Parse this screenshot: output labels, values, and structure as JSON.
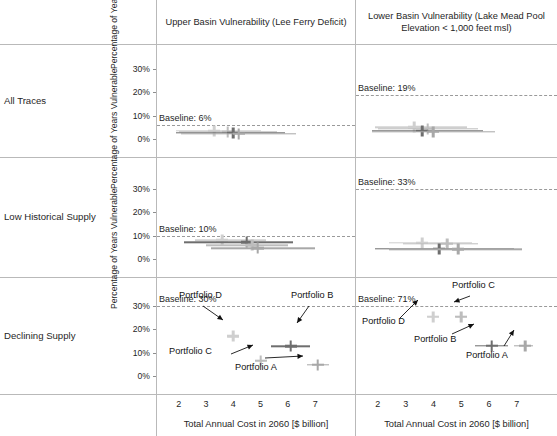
{
  "figure": {
    "columns": [
      {
        "id": "upper",
        "title": "Upper Basin Vulnerability (Lee Ferry Deficit)"
      },
      {
        "id": "lower",
        "title": "Lower Basin Vulnerability (Lake Mead Pool Elevation < 1,000 feet msl)"
      }
    ],
    "rows": [
      {
        "id": "all-traces",
        "label": "All Traces"
      },
      {
        "id": "low-historical-supply",
        "label": "Low Historical Supply"
      },
      {
        "id": "declining-supply",
        "label": "Declining Supply"
      }
    ],
    "y_axis_title": "Percentage of Years Vulnerable",
    "x_axis_title": "Total Annual Cost in 2060 [$ billion]"
  },
  "chart_data": {
    "type": "scatter",
    "title": "",
    "xlabel": "Total Annual Cost in 2060 [$ billion]",
    "ylabel": "Percentage of Years Vulnerable",
    "xlim": [
      1.5,
      7.8
    ],
    "ylim": [
      0,
      33
    ],
    "xticks": [
      2,
      3,
      4,
      5,
      6,
      7
    ],
    "xticklabels": [
      "2",
      "3",
      "4",
      "5",
      "6",
      "7"
    ],
    "yticks": [
      0,
      10,
      20,
      30
    ],
    "yticklabels": [
      "0%",
      "10%",
      "20%",
      "30%"
    ],
    "grid": false,
    "legend": "none",
    "marker": "cross-with-horizontal-error-bars",
    "series_colors": {
      "Portfolio A": "#a8a8a8",
      "Portfolio B": "#6e6e6e",
      "Portfolio C": "#bdbdbd",
      "Portfolio D": "#cfcfcf"
    },
    "panels": [
      {
        "row": "All Traces",
        "column": "Upper Basin Vulnerability (Lee Ferry Deficit)",
        "baseline_label": "Baseline: 6%",
        "baseline_value": 6,
        "points": [
          {
            "name": "Portfolio D",
            "x": 3.3,
            "y": 3.6,
            "xlow": 1.9,
            "xhigh": 5.0
          },
          {
            "name": "Portfolio C",
            "x": 3.8,
            "y": 3.2,
            "xlow": 2.0,
            "xhigh": 5.6
          },
          {
            "name": "Portfolio B",
            "x": 4.0,
            "y": 2.7,
            "xlow": 1.9,
            "xhigh": 5.9
          },
          {
            "name": "Portfolio A",
            "x": 4.2,
            "y": 2.3,
            "xlow": 2.1,
            "xhigh": 6.3
          }
        ]
      },
      {
        "row": "All Traces",
        "column": "Lower Basin Vulnerability (Lake Mead Pool Elevation < 1,000 feet msl)",
        "baseline_label": "Baseline: 19%",
        "baseline_value": 19,
        "points": [
          {
            "name": "Portfolio D",
            "x": 3.3,
            "y": 5.0,
            "xlow": 1.9,
            "xhigh": 5.2
          },
          {
            "name": "Portfolio C",
            "x": 3.8,
            "y": 4.4,
            "xlow": 2.0,
            "xhigh": 5.6
          },
          {
            "name": "Portfolio B",
            "x": 3.6,
            "y": 3.6,
            "xlow": 1.8,
            "xhigh": 5.8
          },
          {
            "name": "Portfolio A",
            "x": 4.0,
            "y": 3.2,
            "xlow": 1.8,
            "xhigh": 6.2
          }
        ]
      },
      {
        "row": "Low Historical Supply",
        "column": "Upper Basin Vulnerability (Lee Ferry Deficit)",
        "baseline_label": "Baseline: 10%",
        "baseline_value": 10,
        "points": [
          {
            "name": "Portfolio D",
            "x": 3.6,
            "y": 8.1,
            "xlow": 2.6,
            "xhigh": 5.2
          },
          {
            "name": "Portfolio B",
            "x": 4.5,
            "y": 7.2,
            "xlow": 2.2,
            "xhigh": 6.2
          },
          {
            "name": "Portfolio C",
            "x": 4.7,
            "y": 5.8,
            "xlow": 3.0,
            "xhigh": 6.0
          },
          {
            "name": "Portfolio A",
            "x": 4.9,
            "y": 4.6,
            "xlow": 3.2,
            "xhigh": 7.0
          }
        ]
      },
      {
        "row": "Low Historical Supply",
        "column": "Lower Basin Vulnerability (Lake Mead Pool Elevation < 1,000 feet msl)",
        "baseline_label": "Baseline: 33%",
        "baseline_value": 33,
        "points": [
          {
            "name": "Portfolio D",
            "x": 3.6,
            "y": 7.0,
            "xlow": 2.4,
            "xhigh": 5.4
          },
          {
            "name": "Portfolio C",
            "x": 4.5,
            "y": 6.6,
            "xlow": 2.9,
            "xhigh": 5.6
          },
          {
            "name": "Portfolio B",
            "x": 4.2,
            "y": 4.4,
            "xlow": 1.9,
            "xhigh": 6.9
          },
          {
            "name": "Portfolio A",
            "x": 4.9,
            "y": 4.2,
            "xlow": 2.4,
            "xhigh": 7.2
          }
        ]
      },
      {
        "row": "Declining Supply",
        "column": "Upper Basin Vulnerability (Lee Ferry Deficit)",
        "baseline_label": "Baseline: 30%",
        "baseline_value": 30,
        "points": [
          {
            "name": "Portfolio D",
            "x": 4.0,
            "y": 17.0,
            "xlow": 3.8,
            "xhigh": 4.2
          },
          {
            "name": "Portfolio B",
            "x": 6.1,
            "y": 12.8,
            "xlow": 5.4,
            "xhigh": 6.8
          },
          {
            "name": "Portfolio C",
            "x": 5.0,
            "y": 6.6,
            "xlow": 4.8,
            "xhigh": 5.2
          },
          {
            "name": "Portfolio A",
            "x": 7.1,
            "y": 4.8,
            "xlow": 6.7,
            "xhigh": 7.5
          }
        ],
        "annotations": [
          {
            "label": "Portfolio D",
            "target": "Portfolio D"
          },
          {
            "label": "Portfolio B",
            "target": "Portfolio B"
          },
          {
            "label": "Portfolio C",
            "target": "Portfolio C"
          },
          {
            "label": "Portfolio A",
            "target": "Portfolio A"
          }
        ]
      },
      {
        "row": "Declining Supply",
        "column": "Lower Basin Vulnerability (Lake Mead Pool Elevation < 1,000 feet msl)",
        "baseline_label": "Baseline: 71%",
        "baseline_value": 71,
        "points": [
          {
            "name": "Portfolio D",
            "x": 4.0,
            "y": 25.5,
            "xlow": 3.8,
            "xhigh": 4.2
          },
          {
            "name": "Portfolio C",
            "x": 5.0,
            "y": 25.5,
            "xlow": 4.8,
            "xhigh": 5.2
          },
          {
            "name": "Portfolio B",
            "x": 6.1,
            "y": 13.0,
            "xlow": 5.5,
            "xhigh": 6.7
          },
          {
            "name": "Portfolio A",
            "x": 7.3,
            "y": 13.0,
            "xlow": 6.9,
            "xhigh": 7.6
          }
        ],
        "annotations": [
          {
            "label": "Portfolio D",
            "target": "Portfolio D"
          },
          {
            "label": "Portfolio C",
            "target": "Portfolio C"
          },
          {
            "label": "Portfolio B",
            "target": "Portfolio B"
          },
          {
            "label": "Portfolio A",
            "target": "Portfolio A"
          }
        ]
      }
    ]
  }
}
